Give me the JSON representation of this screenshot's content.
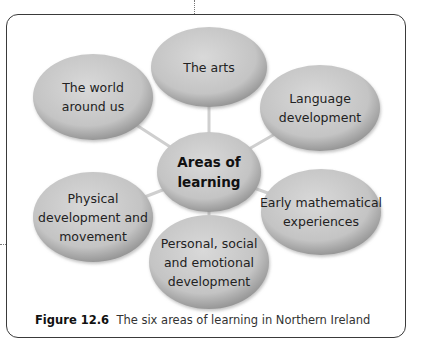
{
  "figure": {
    "caption_label": "Figure 12.6",
    "caption_text": "The six areas of learning in Northern Ireland"
  },
  "diagram": {
    "center": {
      "lines": [
        "Areas of",
        "learning"
      ]
    },
    "nodes": [
      {
        "id": "arts",
        "lines": [
          "The arts"
        ]
      },
      {
        "id": "world",
        "lines": [
          "The world",
          "around us"
        ]
      },
      {
        "id": "language",
        "lines": [
          "Language",
          "development"
        ]
      },
      {
        "id": "physical",
        "lines": [
          "Physical",
          "development and",
          "movement"
        ]
      },
      {
        "id": "maths",
        "lines": [
          "Early mathematical",
          "experiences"
        ]
      },
      {
        "id": "personal",
        "lines": [
          "Personal, social",
          "and emotional",
          "development"
        ]
      }
    ],
    "colors": {
      "fill_light": "#d4d4d4",
      "fill_dark": "#9e9e9e",
      "connector": "#c8c8c8",
      "frame": "#3a3a3a"
    }
  }
}
